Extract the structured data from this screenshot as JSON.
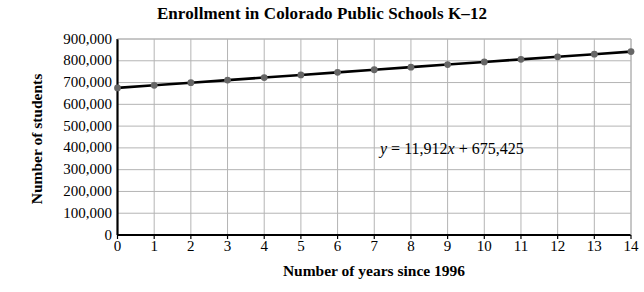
{
  "chart_data": {
    "type": "line",
    "title": "Enrollment in Colorado Public Schools K–12",
    "xlabel": "Number of years since 1996",
    "ylabel": "Number of students",
    "x": [
      0,
      1,
      2,
      3,
      4,
      5,
      6,
      7,
      8,
      9,
      10,
      11,
      12,
      13,
      14
    ],
    "values": [
      675425,
      687337,
      699249,
      711161,
      723073,
      734985,
      746897,
      758809,
      770721,
      782633,
      794545,
      806457,
      818369,
      830281,
      842193
    ],
    "series": [
      {
        "name": "Enrollment",
        "values": [
          675425,
          687337,
          699249,
          711161,
          723073,
          734985,
          746897,
          758809,
          770721,
          782633,
          794545,
          806457,
          818369,
          830281,
          842193
        ]
      }
    ],
    "xlim": [
      0,
      14
    ],
    "ylim": [
      0,
      900000
    ],
    "xticks": [
      "0",
      "1",
      "2",
      "3",
      "4",
      "5",
      "6",
      "7",
      "8",
      "9",
      "10",
      "11",
      "12",
      "13",
      "14"
    ],
    "yticks": [
      "0",
      "100,000",
      "200,000",
      "300,000",
      "400,000",
      "500,000",
      "600,000",
      "700,000",
      "800,000",
      "900,000"
    ],
    "ytick_values": [
      0,
      100000,
      200000,
      300000,
      400000,
      500000,
      600000,
      700000,
      800000,
      900000
    ],
    "grid": true,
    "legend": "none",
    "annotation": {
      "equation": "y = 11,912x + 675,425",
      "equation_parts": {
        "y": "y",
        "eq": " = 11,912",
        "x": "x",
        "rest": " + 675,425"
      },
      "slope": 11912,
      "intercept": 675425
    },
    "colors": {
      "line": "#000000",
      "marker": "#666666",
      "grid": "#b4b4b4",
      "axis": "#000000",
      "background": "#ffffff"
    }
  }
}
